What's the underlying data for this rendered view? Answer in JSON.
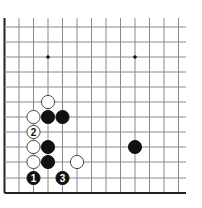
{
  "diagram": {
    "type": "go-board-fragment",
    "grid": {
      "x_lines": [
        4.5,
        19,
        33.5,
        48,
        62.5,
        77,
        91.5,
        106,
        120.5,
        135,
        149.5,
        164,
        178.5
      ],
      "y_lines": [
        27,
        42,
        57,
        72,
        87,
        102,
        117,
        132,
        147,
        162,
        178,
        193
      ],
      "right_extent": 186,
      "top_extent": 18,
      "line_color": "#8a8a8a",
      "edge_color": "#222222"
    },
    "star_points": [
      {
        "col": 3,
        "row": 2
      },
      {
        "col": 9,
        "row": 2
      }
    ],
    "stones": [
      {
        "color": "white",
        "col": 3,
        "row": 5,
        "label": ""
      },
      {
        "color": "white",
        "col": 2,
        "row": 6,
        "label": ""
      },
      {
        "color": "black",
        "col": 3,
        "row": 6,
        "label": ""
      },
      {
        "color": "black",
        "col": 4,
        "row": 6,
        "label": ""
      },
      {
        "color": "white",
        "col": 2,
        "row": 7,
        "label": "2"
      },
      {
        "color": "white",
        "col": 2,
        "row": 8,
        "label": ""
      },
      {
        "color": "black",
        "col": 3,
        "row": 8,
        "label": ""
      },
      {
        "color": "black",
        "col": 9,
        "row": 8,
        "label": ""
      },
      {
        "color": "white",
        "col": 2,
        "row": 9,
        "label": ""
      },
      {
        "color": "black",
        "col": 3,
        "row": 9,
        "label": ""
      },
      {
        "color": "white",
        "col": 5,
        "row": 9,
        "label": ""
      },
      {
        "color": "black",
        "col": 2,
        "row": 10,
        "label": "1"
      },
      {
        "color": "black",
        "col": 4,
        "row": 10,
        "label": "3"
      }
    ]
  }
}
